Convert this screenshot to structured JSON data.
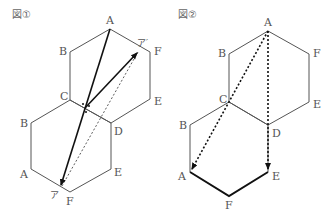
{
  "figures": [
    {
      "title": "図①",
      "top_hexagon": {
        "A": "A",
        "B": "B",
        "C": "C",
        "D": "D",
        "E": "E",
        "F": "F"
      },
      "bottom_hexagon": {
        "A": "A",
        "B": "B",
        "C": "C",
        "D": "D",
        "E": "E",
        "F": "F"
      },
      "arrows": {
        "a": "ア",
        "a_prime": "ア′"
      }
    },
    {
      "title": "図②",
      "top_hexagon": {
        "A": "A",
        "B": "B",
        "C": "C",
        "D": "D",
        "E": "E",
        "F": "F"
      },
      "bottom_hexagon": {
        "A": "A",
        "B": "B",
        "C": "C",
        "D": "D",
        "E": "E",
        "F": "F"
      }
    }
  ]
}
